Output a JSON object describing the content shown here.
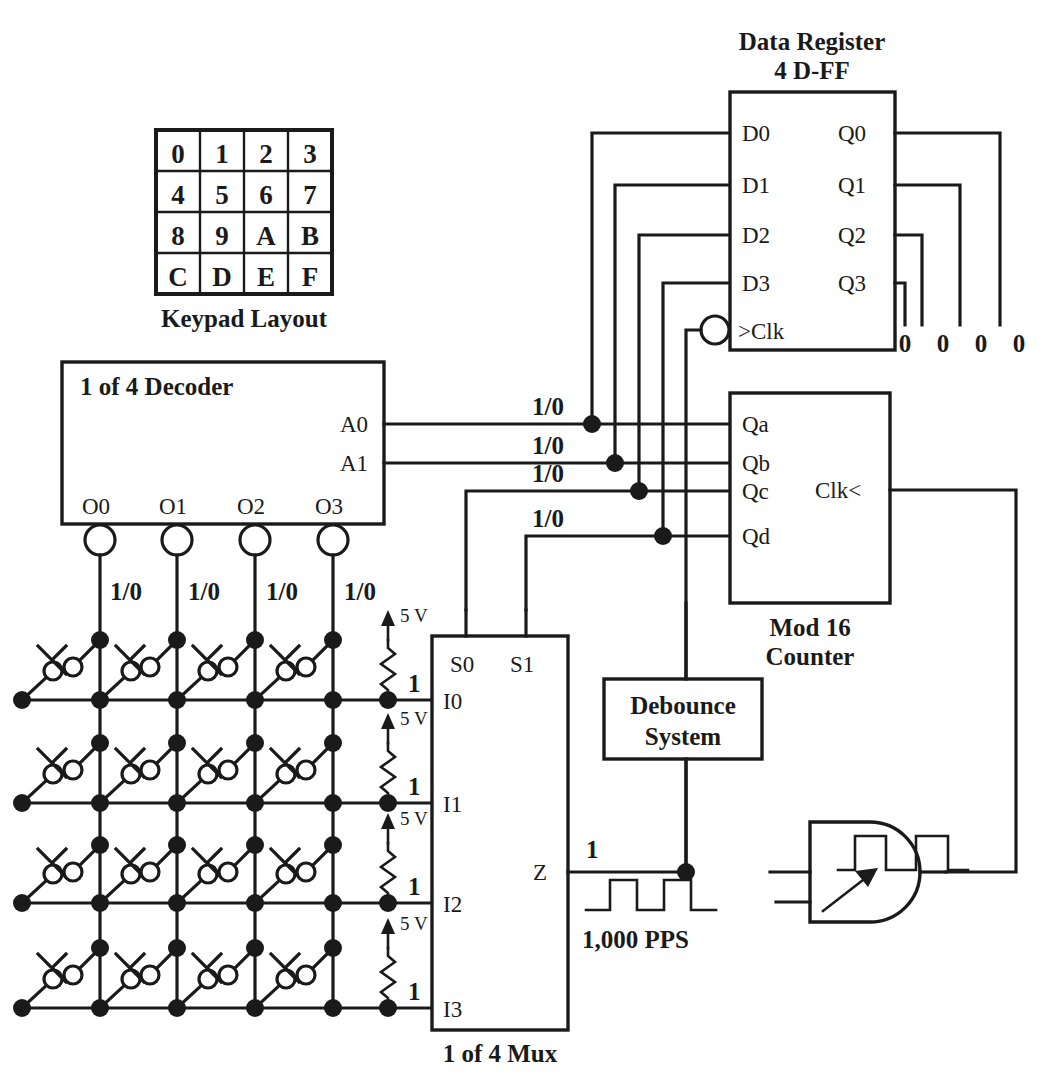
{
  "diagram": {
    "keypad": {
      "caption": "Keypad Layout",
      "rows": [
        [
          "0",
          "1",
          "2",
          "3"
        ],
        [
          "4",
          "5",
          "6",
          "7"
        ],
        [
          "8",
          "9",
          "A",
          "B"
        ],
        [
          "C",
          "D",
          "E",
          "F"
        ]
      ]
    },
    "blocks": {
      "data_register": {
        "title_line1": "Data Register",
        "title_line2": "4 D-FF",
        "inputs": [
          "D0",
          "D1",
          "D2",
          "D3"
        ],
        "clock": ">Clk",
        "outputs": [
          "Q0",
          "Q1",
          "Q2",
          "Q3"
        ],
        "output_values": [
          "0",
          "0",
          "0",
          "0"
        ]
      },
      "decoder": {
        "title": "1 of 4 Decoder",
        "address_pins": [
          "A0",
          "A1"
        ],
        "output_pins": [
          "O0",
          "O1",
          "O2",
          "O3"
        ],
        "output_signals": [
          "1/0",
          "1/0",
          "1/0",
          "1/0"
        ]
      },
      "counter": {
        "caption_line1": "Mod 16",
        "caption_line2": "Counter",
        "outputs": [
          "Qa",
          "Qb",
          "Qc",
          "Qd"
        ],
        "clock": "Clk<",
        "output_signals": [
          "1/0",
          "1/0",
          "1/0",
          "1/0"
        ]
      },
      "mux": {
        "caption": "1 of 4 Mux",
        "select_pins": [
          "S0",
          "S1"
        ],
        "inputs": [
          "I0",
          "I1",
          "I2",
          "I3"
        ],
        "output_pin": "Z",
        "output_value": "1"
      },
      "debounce": {
        "title_line1": "Debounce",
        "title_line2": "System"
      },
      "and_gate": {
        "name": "and-gate"
      }
    },
    "pullups": {
      "voltage_label": "5 V",
      "level_label": "1",
      "count": 4
    },
    "clock_source": {
      "label": "1,000 PPS"
    }
  }
}
